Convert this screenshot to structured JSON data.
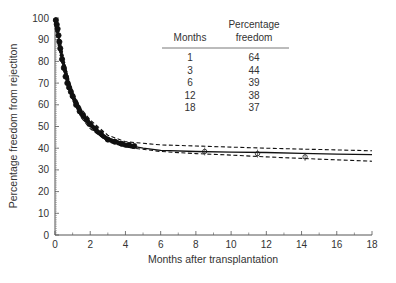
{
  "chart_data": {
    "type": "line",
    "title": "",
    "xlabel": "Months after transplantation",
    "ylabel": "Percentage freedom from rejectiton",
    "xlim": [
      0,
      18
    ],
    "ylim": [
      0,
      100
    ],
    "xticks": [
      0,
      2,
      4,
      6,
      8,
      10,
      12,
      14,
      16,
      18
    ],
    "yticks": [
      0,
      10,
      20,
      30,
      40,
      50,
      60,
      70,
      80,
      90,
      100
    ],
    "grid": false,
    "series": [
      {
        "name": "Fitted curve",
        "style": "solid",
        "x": [
          0,
          0.1,
          0.25,
          0.5,
          0.75,
          1,
          1.5,
          2,
          2.5,
          3,
          4,
          5,
          6,
          8,
          10,
          12,
          14,
          16,
          18
        ],
        "y": [
          100,
          96,
          88,
          78,
          70,
          64,
          56,
          51,
          47,
          44,
          41.5,
          40,
          39,
          38.5,
          38.2,
          38,
          37.6,
          37.3,
          37
        ]
      },
      {
        "name": "Upper confidence bound",
        "style": "dashed",
        "x": [
          0,
          0.5,
          1,
          1.5,
          2,
          3,
          4,
          6,
          8,
          10,
          12,
          14,
          16,
          18
        ],
        "y": [
          100,
          80,
          66,
          58,
          53,
          46,
          43,
          41.5,
          41,
          40.5,
          40,
          39.6,
          39.2,
          38.8
        ]
      },
      {
        "name": "Lower confidence bound",
        "style": "dashed",
        "x": [
          0,
          0.5,
          1,
          1.5,
          2,
          3,
          4,
          6,
          8,
          10,
          12,
          14,
          16,
          18
        ],
        "y": [
          100,
          76,
          62,
          54,
          49,
          43,
          40.5,
          38.5,
          37.5,
          36.8,
          36,
          35.3,
          34.6,
          34
        ]
      },
      {
        "name": "Observed data",
        "style": "markers",
        "x": [
          0.05,
          0.1,
          0.15,
          0.2,
          0.25,
          0.3,
          0.4,
          0.5,
          0.6,
          0.7,
          0.8,
          0.9,
          1.0,
          1.2,
          1.4,
          1.6,
          1.8,
          2.0,
          2.3,
          2.6,
          3.0,
          3.4,
          3.8,
          4.2,
          4.5,
          8.5,
          11.5,
          14.2
        ],
        "y": [
          99,
          97,
          95,
          92,
          89,
          86,
          81,
          77,
          73,
          70,
          68,
          66,
          64,
          60,
          57,
          55,
          53,
          51,
          49,
          47,
          44,
          43,
          42,
          41.5,
          41,
          38.5,
          37.5,
          36
        ]
      }
    ],
    "inset_table": {
      "headers": [
        "Months",
        "Percentage freedom"
      ],
      "header_lines": [
        [
          "",
          "Percentage"
        ],
        [
          "Months",
          "freedom"
        ]
      ],
      "rows": [
        [
          "1",
          "64"
        ],
        [
          "3",
          "44"
        ],
        [
          "6",
          "39"
        ],
        [
          "12",
          "38"
        ],
        [
          "18",
          "37"
        ]
      ]
    }
  }
}
